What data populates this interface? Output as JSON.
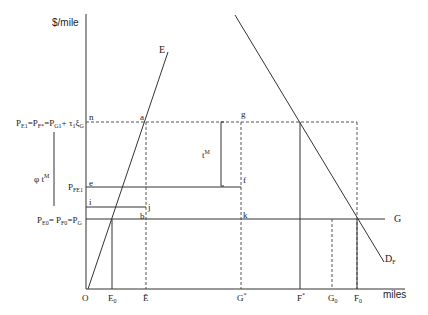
{
  "diagram": {
    "y_axis_label": "$/mile",
    "x_axis_label": "miles",
    "origin_label": "O",
    "curves": {
      "E": "E",
      "D_F": {
        "main": "D",
        "sub": "F"
      },
      "G": "G"
    },
    "price_labels": {
      "top": {
        "parts": [
          {
            "t": "P",
            "sub": "E1"
          },
          {
            "t": "=P",
            "sub": "F*"
          },
          {
            "t": "=P",
            "sub": "G1"
          },
          {
            "t": "+ τ",
            "sub": "1"
          },
          {
            "t": "ξ",
            "sub": "G"
          }
        ]
      },
      "middle": {
        "main": "P",
        "sub": "FE1"
      },
      "bottom": {
        "parts": [
          {
            "t": "P",
            "sub": "E0"
          },
          {
            "t": "= P",
            "sub": "F0"
          },
          {
            "t": "=P",
            "sub": "G"
          }
        ]
      }
    },
    "brace_labels": {
      "phi_tM": {
        "main": "φ t",
        "sup": "M"
      },
      "tM": {
        "main": "t",
        "sup": "M"
      }
    },
    "points": {
      "n": "n",
      "a": "a",
      "g": "g",
      "e": "e",
      "f": "f",
      "i": "i",
      "j": "j",
      "b": "b",
      "k": "k"
    },
    "x_ticks": [
      {
        "main": "O",
        "sub": ""
      },
      {
        "main": "E",
        "sub": "0"
      },
      {
        "main": "Ē",
        "sub": ""
      },
      {
        "main": "G",
        "sup": "*"
      },
      {
        "main": "F",
        "sup": "*"
      },
      {
        "main": "G",
        "sub": "0"
      },
      {
        "main": "F",
        "sub": "0"
      }
    ]
  }
}
